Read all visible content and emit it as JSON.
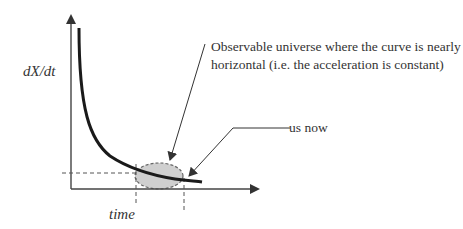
{
  "diagram": {
    "y_axis_label": "dX/dt",
    "x_axis_label": "time",
    "annotation_region": {
      "line1": "Observable universe where the curve is nearly",
      "line2": "horizontal (i.e. the acceleration is constant)"
    },
    "annotation_now": "us now",
    "colors": {
      "curve": "#1a1a1a",
      "axis": "#444444",
      "ellipse_fill": "#cfcfcf",
      "ellipse_stroke": "#666666",
      "dashed": "#555555",
      "text": "#333333"
    }
  }
}
